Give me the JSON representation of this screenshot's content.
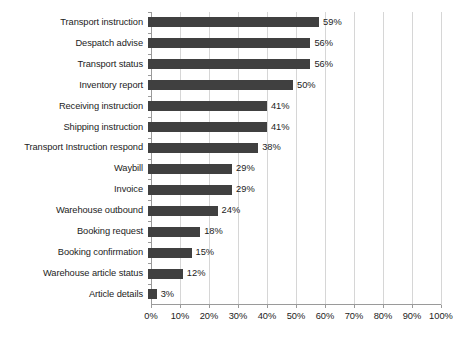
{
  "chart_data": {
    "type": "bar",
    "orientation": "horizontal",
    "title": "",
    "subtitle": "",
    "xlabel": "",
    "ylabel": "",
    "xlim": [
      0,
      100
    ],
    "grid": true,
    "legend": false,
    "bar_color": "#404040",
    "gridline_color": "#d6d6d6",
    "axis_color": "#9a9a9a",
    "value_suffix": "%",
    "categories": [
      "Transport instruction",
      "Despatch advise",
      "Transport status",
      "Inventory report",
      "Receiving instruction",
      "Shipping instruction",
      "Transport Instruction respond",
      "Waybill",
      "Invoice",
      "Warehouse outbound",
      "Booking request",
      "Booking confirmation",
      "Warehouse article status",
      "Article details"
    ],
    "values": [
      59,
      56,
      56,
      50,
      41,
      41,
      38,
      29,
      29,
      24,
      18,
      15,
      12,
      3
    ],
    "data_labels": [
      "59%",
      "56%",
      "56%",
      "50%",
      "41%",
      "41%",
      "38%",
      "29%",
      "29%",
      "24%",
      "18%",
      "15%",
      "12%",
      "3%"
    ],
    "xticks": [
      0,
      10,
      20,
      30,
      40,
      50,
      60,
      70,
      80,
      90,
      100
    ],
    "xtick_labels": [
      "0%",
      "10%",
      "20%",
      "30%",
      "40%",
      "50%",
      "60%",
      "70%",
      "80%",
      "90%",
      "100%"
    ]
  }
}
